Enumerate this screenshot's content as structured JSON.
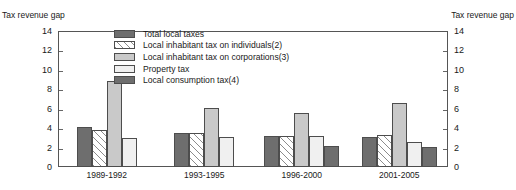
{
  "title_fragment": "",
  "axis_caption_left": "Tax revenue gap",
  "axis_caption_right": "Tax revenue gap",
  "legend": [
    {
      "label": "Total local taxes",
      "key": "total",
      "swatch": "solid-dark-gray-swatch"
    },
    {
      "label": "Local inhabitant tax on individuals(2)",
      "key": "individuals",
      "swatch": "diagonal-hatch-swatch"
    },
    {
      "label": "Local inhabitant tax on corporations(3)",
      "key": "corporations",
      "swatch": "solid-light-gray-swatch"
    },
    {
      "label": "Property tax",
      "key": "property",
      "swatch": "solid-very-light-gray-swatch"
    },
    {
      "label": "Local consumption tax(4)",
      "key": "consumption",
      "swatch": "solid-dark-gray-swatch"
    }
  ],
  "colors": {
    "total": "#6e6e6e",
    "individuals": "#ffffff",
    "corporations": "#c9c9c9",
    "property": "#f0f0f0",
    "consumption": "#6e6e6e",
    "axis": "#555555"
  },
  "chart_data": {
    "type": "bar",
    "title": "",
    "xlabel": "",
    "ylabel": "Tax revenue gap",
    "ylim": [
      0,
      14
    ],
    "yticks": [
      0,
      2,
      4,
      6,
      8,
      10,
      12,
      14
    ],
    "ytick_labels": [
      "0",
      "2",
      "4",
      "6",
      "8",
      "10",
      "12",
      "14"
    ],
    "grid": false,
    "legend_position": "inside-top-left",
    "categories": [
      "1989-1992",
      "1993-1995",
      "1996-2000",
      "2001-2005"
    ],
    "series": [
      {
        "name": "Total local taxes",
        "values": [
          4.1,
          3.5,
          3.2,
          3.1
        ]
      },
      {
        "name": "Local inhabitant tax on individuals(2)",
        "values": [
          3.8,
          3.5,
          3.2,
          3.3
        ]
      },
      {
        "name": "Local inhabitant tax on corporations(3)",
        "values": [
          8.9,
          6.1,
          5.6,
          6.6
        ]
      },
      {
        "name": "Property tax",
        "values": [
          3.0,
          3.1,
          3.2,
          2.6
        ]
      },
      {
        "name": "Local consumption tax(4)",
        "values": [
          null,
          null,
          2.2,
          2.1
        ]
      }
    ]
  }
}
